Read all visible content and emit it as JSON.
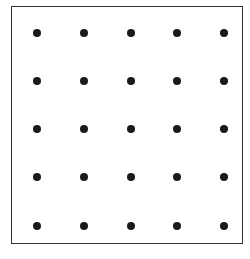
{
  "diagram": {
    "type": "dot-grid",
    "rows": 5,
    "columns": 5,
    "dot_color": "#1a1a1a",
    "border_color": "#333333",
    "background_color": "#ffffff",
    "column_x": [
      37,
      84,
      131,
      177,
      224
    ],
    "row_y": [
      33,
      81,
      129,
      177,
      226
    ]
  }
}
